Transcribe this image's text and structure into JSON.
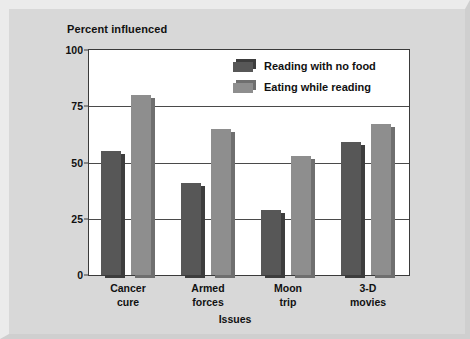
{
  "chart_data": {
    "type": "bar",
    "title": "",
    "subtitle": "",
    "xlabel": "Issues",
    "ylabel": "Percent influenced",
    "categories": [
      "Cancer cure",
      "Armed forces",
      "Moon trip",
      "3-D movies"
    ],
    "category_lines": [
      [
        "Cancer",
        "cure"
      ],
      [
        "Armed",
        "forces"
      ],
      [
        "Moon",
        "trip"
      ],
      [
        "3-D",
        "movies"
      ]
    ],
    "series": [
      {
        "name": "Reading with no food",
        "values": [
          55,
          41,
          29,
          59
        ],
        "color": "#575757"
      },
      {
        "name": "Eating while reading",
        "values": [
          80,
          65,
          53,
          67
        ],
        "color": "#8e8e8e"
      }
    ],
    "ylim": [
      0,
      100
    ],
    "yticks": [
      0,
      25,
      50,
      75,
      100
    ],
    "ytick_labels": [
      "0",
      "25",
      "50",
      "75",
      "100"
    ],
    "grid": true,
    "grid_axis": "y",
    "legend_position": "top-right",
    "bar_style": "3d-offset-shadow"
  },
  "figure": {
    "background": "#d8d8d8",
    "plot_background": "#ffffff",
    "axis_color": "#3a3a3a",
    "text_color": "#111111"
  },
  "axes": {
    "y_title": "Percent influenced",
    "x_title": "Issues"
  },
  "legend": {
    "entries": [
      {
        "label": "Reading with no food",
        "color": "#575757"
      },
      {
        "label": "Eating while reading",
        "color": "#8e8e8e"
      }
    ]
  }
}
